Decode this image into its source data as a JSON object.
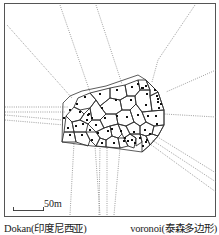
{
  "figure": {
    "scale_bar": {
      "label": "50m"
    },
    "captions": {
      "left": "Dokan(印度尼西亚)",
      "right": "voronoi(泰森多边形)"
    },
    "colors": {
      "frame": "#555555",
      "cell_edge": "#333333",
      "dotted_ray": "#777777",
      "point": "#111111",
      "background": "#ffffff"
    },
    "hull": [
      [
        63,
        103
      ],
      [
        70,
        96
      ],
      [
        82,
        91
      ],
      [
        106,
        86
      ],
      [
        138,
        75
      ],
      [
        146,
        80
      ],
      [
        158,
        92
      ],
      [
        164,
        110
      ],
      [
        164,
        125
      ],
      [
        158,
        136
      ],
      [
        150,
        145
      ],
      [
        142,
        152
      ],
      [
        106,
        147
      ],
      [
        92,
        146
      ],
      [
        62,
        142
      ]
    ],
    "rays": [
      [
        [
          5,
          107
        ],
        [
          68,
          107
        ]
      ],
      [
        [
          5,
          112
        ],
        [
          65,
          112
        ]
      ],
      [
        [
          7,
          25
        ],
        [
          72,
          98
        ]
      ],
      [
        [
          60,
          5
        ],
        [
          90,
          92
        ]
      ],
      [
        [
          96,
          5
        ],
        [
          122,
          84
        ]
      ],
      [
        [
          195,
          5
        ],
        [
          158,
          60
        ],
        [
          152,
          82
        ]
      ],
      [
        [
          216,
          70
        ],
        [
          166,
          92
        ]
      ],
      [
        [
          216,
          117
        ],
        [
          164,
          114
        ]
      ],
      [
        [
          216,
          173
        ],
        [
          156,
          136
        ]
      ],
      [
        [
          216,
          192
        ],
        [
          150,
          144
        ]
      ],
      [
        [
          216,
          182
        ],
        [
          152,
          140
        ]
      ],
      [
        [
          5,
          120
        ],
        [
          64,
          125
        ]
      ],
      [
        [
          5,
          115
        ],
        [
          62,
          120
        ]
      ],
      [
        [
          70,
          215
        ],
        [
          74,
          143
        ]
      ],
      [
        [
          100,
          215
        ],
        [
          95,
          146
        ]
      ],
      [
        [
          107,
          215
        ],
        [
          107,
          147
        ]
      ],
      [
        [
          114,
          215
        ],
        [
          120,
          148
        ]
      ],
      [
        [
          99,
          215
        ],
        [
          100,
          147
        ]
      ]
    ],
    "points": [
      [
        77,
        104
      ],
      [
        85,
        97
      ],
      [
        100,
        94
      ],
      [
        117,
        90
      ],
      [
        132,
        87
      ],
      [
        138,
        84
      ],
      [
        143,
        88
      ],
      [
        147,
        94
      ],
      [
        157,
        96
      ],
      [
        158,
        102
      ],
      [
        70,
        110
      ],
      [
        80,
        112
      ],
      [
        88,
        115
      ],
      [
        89,
        114
      ],
      [
        92,
        118
      ],
      [
        87,
        120
      ],
      [
        83,
        124
      ],
      [
        76,
        126
      ],
      [
        68,
        128
      ],
      [
        64,
        118
      ],
      [
        102,
        108
      ],
      [
        116,
        100
      ],
      [
        131,
        100
      ],
      [
        146,
        105
      ],
      [
        159,
        108
      ],
      [
        156,
        116
      ],
      [
        148,
        116
      ],
      [
        138,
        115
      ],
      [
        127,
        117
      ],
      [
        117,
        116
      ],
      [
        105,
        118
      ],
      [
        96,
        125
      ],
      [
        90,
        130
      ],
      [
        98,
        133
      ],
      [
        108,
        131
      ],
      [
        112,
        129
      ],
      [
        121,
        131
      ],
      [
        134,
        132
      ],
      [
        145,
        130
      ],
      [
        157,
        124
      ],
      [
        70,
        135
      ],
      [
        82,
        135
      ],
      [
        92,
        140
      ],
      [
        102,
        143
      ],
      [
        114,
        143
      ],
      [
        124,
        141
      ],
      [
        132,
        140
      ],
      [
        140,
        138
      ],
      [
        146,
        142
      ],
      [
        150,
        134
      ],
      [
        146,
        86
      ],
      [
        142,
        88
      ],
      [
        155,
        90
      ],
      [
        158,
        99
      ],
      [
        161,
        104
      ],
      [
        125,
        138
      ],
      [
        128,
        141
      ],
      [
        135,
        143
      ],
      [
        143,
        146
      ],
      [
        147,
        140
      ]
    ],
    "cells": [
      [
        [
          74,
          107
        ],
        [
          78,
          98
        ],
        [
          90,
          93
        ],
        [
          96,
          100
        ],
        [
          90,
          108
        ],
        [
          80,
          110
        ]
      ],
      [
        [
          90,
          93
        ],
        [
          110,
          88
        ],
        [
          110,
          98
        ],
        [
          100,
          106
        ],
        [
          96,
          100
        ]
      ],
      [
        [
          110,
          88
        ],
        [
          125,
          85
        ],
        [
          127,
          96
        ],
        [
          120,
          100
        ],
        [
          110,
          98
        ]
      ],
      [
        [
          125,
          85
        ],
        [
          138,
          80
        ],
        [
          140,
          90
        ],
        [
          135,
          96
        ],
        [
          127,
          96
        ]
      ],
      [
        [
          138,
          80
        ],
        [
          146,
          80
        ],
        [
          150,
          90
        ],
        [
          140,
          90
        ]
      ],
      [
        [
          146,
          80
        ],
        [
          158,
          92
        ],
        [
          150,
          96
        ],
        [
          150,
          90
        ]
      ],
      [
        [
          150,
          96
        ],
        [
          158,
          92
        ],
        [
          164,
          110
        ],
        [
          152,
          111
        ]
      ],
      [
        [
          140,
          90
        ],
        [
          150,
          90
        ],
        [
          150,
          96
        ],
        [
          152,
          111
        ],
        [
          142,
          112
        ],
        [
          136,
          104
        ],
        [
          135,
          96
        ]
      ],
      [
        [
          127,
          96
        ],
        [
          135,
          96
        ],
        [
          136,
          104
        ],
        [
          130,
          110
        ],
        [
          122,
          110
        ],
        [
          120,
          100
        ]
      ],
      [
        [
          100,
          106
        ],
        [
          110,
          98
        ],
        [
          120,
          100
        ],
        [
          122,
          110
        ],
        [
          116,
          114
        ],
        [
          106,
          114
        ]
      ],
      [
        [
          90,
          108
        ],
        [
          96,
          100
        ],
        [
          100,
          106
        ],
        [
          106,
          114
        ],
        [
          100,
          120
        ],
        [
          92,
          120
        ]
      ],
      [
        [
          74,
          107
        ],
        [
          80,
          110
        ],
        [
          84,
          114
        ],
        [
          80,
          120
        ],
        [
          72,
          122
        ],
        [
          66,
          116
        ]
      ],
      [
        [
          84,
          114
        ],
        [
          90,
          108
        ],
        [
          92,
          120
        ],
        [
          88,
          124
        ],
        [
          80,
          120
        ]
      ],
      [
        [
          66,
          116
        ],
        [
          72,
          122
        ],
        [
          74,
          132
        ],
        [
          64,
          132
        ]
      ],
      [
        [
          72,
          122
        ],
        [
          80,
          120
        ],
        [
          88,
          124
        ],
        [
          86,
          132
        ],
        [
          74,
          132
        ]
      ],
      [
        [
          92,
          120
        ],
        [
          100,
          120
        ],
        [
          104,
          128
        ],
        [
          96,
          132
        ],
        [
          88,
          124
        ]
      ],
      [
        [
          100,
          120
        ],
        [
          106,
          114
        ],
        [
          116,
          114
        ],
        [
          118,
          124
        ],
        [
          110,
          126
        ],
        [
          104,
          128
        ]
      ],
      [
        [
          116,
          114
        ],
        [
          122,
          110
        ],
        [
          130,
          110
        ],
        [
          134,
          122
        ],
        [
          126,
          126
        ],
        [
          118,
          124
        ]
      ],
      [
        [
          130,
          110
        ],
        [
          136,
          104
        ],
        [
          142,
          112
        ],
        [
          146,
          122
        ],
        [
          140,
          126
        ],
        [
          134,
          122
        ]
      ],
      [
        [
          142,
          112
        ],
        [
          152,
          111
        ],
        [
          164,
          110
        ],
        [
          164,
          125
        ],
        [
          154,
          126
        ],
        [
          146,
          122
        ]
      ],
      [
        [
          64,
          132
        ],
        [
          74,
          132
        ],
        [
          76,
          142
        ],
        [
          62,
          142
        ]
      ],
      [
        [
          74,
          132
        ],
        [
          86,
          132
        ],
        [
          90,
          140
        ],
        [
          88,
          146
        ],
        [
          76,
          142
        ]
      ],
      [
        [
          86,
          132
        ],
        [
          96,
          132
        ],
        [
          100,
          138
        ],
        [
          96,
          146
        ],
        [
          90,
          140
        ]
      ],
      [
        [
          96,
          132
        ],
        [
          104,
          128
        ],
        [
          110,
          126
        ],
        [
          112,
          136
        ],
        [
          106,
          140
        ],
        [
          100,
          138
        ]
      ],
      [
        [
          110,
          126
        ],
        [
          118,
          124
        ],
        [
          122,
          134
        ],
        [
          118,
          138
        ],
        [
          112,
          136
        ]
      ],
      [
        [
          118,
          124
        ],
        [
          126,
          126
        ],
        [
          130,
          134
        ],
        [
          124,
          138
        ],
        [
          122,
          134
        ]
      ],
      [
        [
          126,
          126
        ],
        [
          134,
          122
        ],
        [
          140,
          126
        ],
        [
          140,
          134
        ],
        [
          130,
          134
        ]
      ],
      [
        [
          140,
          126
        ],
        [
          146,
          122
        ],
        [
          154,
          126
        ],
        [
          152,
          134
        ],
        [
          146,
          136
        ],
        [
          140,
          134
        ]
      ],
      [
        [
          154,
          126
        ],
        [
          164,
          125
        ],
        [
          158,
          136
        ],
        [
          152,
          134
        ]
      ],
      [
        [
          96,
          146
        ],
        [
          100,
          138
        ],
        [
          106,
          140
        ],
        [
          106,
          147
        ]
      ],
      [
        [
          106,
          140
        ],
        [
          112,
          136
        ],
        [
          118,
          138
        ],
        [
          120,
          148
        ],
        [
          106,
          147
        ]
      ],
      [
        [
          118,
          138
        ],
        [
          124,
          138
        ],
        [
          128,
          146
        ],
        [
          120,
          148
        ]
      ],
      [
        [
          124,
          138
        ],
        [
          130,
          134
        ],
        [
          136,
          138
        ],
        [
          134,
          148
        ],
        [
          128,
          146
        ]
      ],
      [
        [
          130,
          134
        ],
        [
          140,
          134
        ],
        [
          142,
          142
        ],
        [
          136,
          146
        ],
        [
          136,
          138
        ]
      ],
      [
        [
          140,
          134
        ],
        [
          146,
          136
        ],
        [
          150,
          145
        ],
        [
          142,
          152
        ],
        [
          142,
          142
        ]
      ],
      [
        [
          146,
          136
        ],
        [
          152,
          134
        ],
        [
          158,
          136
        ],
        [
          150,
          145
        ]
      ]
    ]
  }
}
